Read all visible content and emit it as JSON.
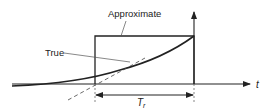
{
  "diagram": {
    "labels": {
      "approximate": "Approximate",
      "true": "True",
      "time_axis": "t",
      "rise_time_main": "T",
      "rise_time_sub": "r"
    },
    "colors": {
      "line": "#222222",
      "thin_line": "#555555",
      "background": "#ffffff"
    }
  }
}
